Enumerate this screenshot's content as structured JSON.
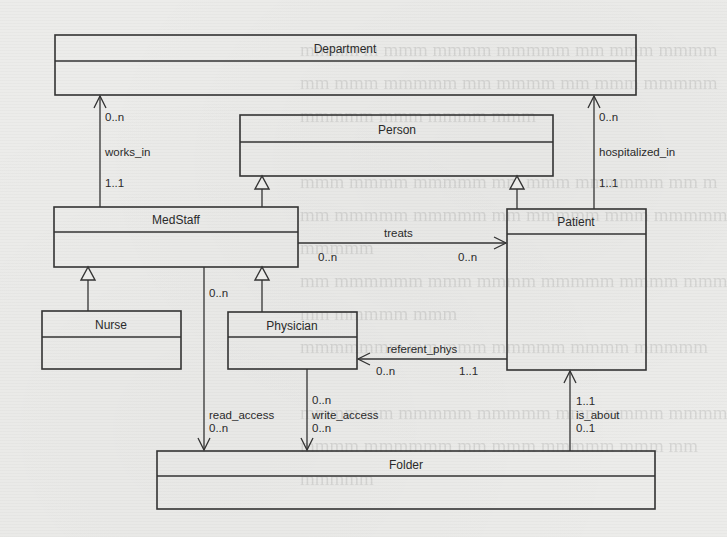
{
  "diagram": {
    "type": "UML class diagram",
    "classes": [
      {
        "id": "department",
        "name": "Department",
        "box": {
          "x": 55,
          "y": 35,
          "w": 581,
          "h": 60,
          "divider_y": 61
        }
      },
      {
        "id": "person",
        "name": "Person",
        "box": {
          "x": 240,
          "y": 115,
          "w": 313,
          "h": 61,
          "divider_y": 142
        }
      },
      {
        "id": "medstaff",
        "name": "MedStaff",
        "box": {
          "x": 54,
          "y": 207,
          "w": 244,
          "h": 60,
          "divider_y": 232
        }
      },
      {
        "id": "patient",
        "name": "Patient",
        "box": {
          "x": 507,
          "y": 209,
          "w": 139,
          "h": 161,
          "divider_y": 234
        }
      },
      {
        "id": "nurse",
        "name": "Nurse",
        "box": {
          "x": 42,
          "y": 311,
          "w": 139,
          "h": 58,
          "divider_y": 337
        }
      },
      {
        "id": "physician",
        "name": "Physician",
        "box": {
          "x": 228,
          "y": 312,
          "w": 129,
          "h": 57,
          "divider_y": 337
        }
      },
      {
        "id": "folder",
        "name": "Folder",
        "box": {
          "x": 157,
          "y": 451,
          "w": 498,
          "h": 58,
          "divider_y": 476
        }
      }
    ],
    "generalizations": [
      {
        "child": "MedStaff",
        "parent": "Person"
      },
      {
        "child": "Patient",
        "parent": "Person"
      },
      {
        "child": "Nurse",
        "parent": "MedStaff"
      },
      {
        "child": "Physician",
        "parent": "MedStaff"
      }
    ],
    "associations": [
      {
        "name": "works_in",
        "from": "MedStaff",
        "to": "Department",
        "from_mult": "1..1",
        "to_mult": "0..n"
      },
      {
        "name": "hospitalized_in",
        "from": "Patient",
        "to": "Department",
        "from_mult": "1..1",
        "to_mult": "0..n"
      },
      {
        "name": "treats",
        "from": "MedStaff",
        "to": "Patient",
        "from_mult": "0..n",
        "to_mult": "0..n"
      },
      {
        "name": "referent_phys",
        "from": "Patient",
        "to": "Physician",
        "from_mult": "1..1",
        "to_mult": "0..n"
      },
      {
        "name": "read_access",
        "from": "MedStaff",
        "to": "Folder",
        "from_mult": "0..n",
        "to_mult": "0..n"
      },
      {
        "name": "write_access",
        "from": "Physician",
        "to": "Folder",
        "from_mult": "0..n",
        "to_mult": "0..n"
      },
      {
        "name": "is_about",
        "from": "Folder",
        "to": "Patient",
        "from_mult": "0..1",
        "to_mult": "1..1"
      }
    ]
  },
  "labels": {
    "department": "Department",
    "person": "Person",
    "medstaff": "MedStaff",
    "patient": "Patient",
    "nurse": "Nurse",
    "physician": "Physician",
    "folder": "Folder",
    "works_in": "works_in",
    "works_in_dept_mult": "0..n",
    "works_in_staff_mult": "1..1",
    "hospitalized_in": "hospitalized_in",
    "hosp_dept_mult": "0..n",
    "hosp_patient_mult": "1..1",
    "treats": "treats",
    "treats_staff_mult": "0..n",
    "treats_patient_mult": "0..n",
    "referent_phys": "referent_phys",
    "ref_phys_mult": "0..n",
    "ref_patient_mult": "1..1",
    "read_access": "read_access",
    "read_staff_mult": "0..n",
    "read_folder_mult": "0..n",
    "write_access": "write_access",
    "write_phys_mult": "0..n",
    "write_folder_mult": "0..n",
    "is_about": "is_about",
    "is_about_patient_mult": "1..1",
    "is_about_folder_mult": "0..1"
  },
  "colors": {
    "background": "#ececea",
    "line": "#333333",
    "text": "#2a2a2a"
  }
}
